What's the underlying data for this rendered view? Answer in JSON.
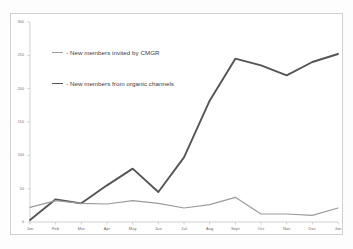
{
  "figure": {
    "background_color": "#fdfdfd",
    "plot_border_color": "#cfcfcf"
  },
  "legend": {
    "position": "inside-top-left",
    "entries": [
      {
        "label": "- New members invited by CMGR",
        "color": "#9b9b9b",
        "swatch": "line-swatch-light"
      },
      {
        "label": "- New members from organic channels",
        "color": "#555555",
        "swatch": "line-swatch-dark"
      }
    ]
  },
  "axes": {
    "y_ticks": [
      "0",
      "50",
      "100",
      "150",
      "200",
      "250",
      "300"
    ],
    "x_ticks": [
      "Jan",
      "Feb",
      "Mar",
      "Apr",
      "May",
      "Jun",
      "Jul",
      "Aug",
      "Sept",
      "Oct",
      "Nov",
      "Dec",
      "Jan"
    ]
  },
  "chart_data": {
    "type": "line",
    "title": "",
    "xlabel": "",
    "ylabel": "",
    "ylim": [
      0,
      300
    ],
    "yticks": [
      0,
      50,
      100,
      150,
      200,
      250,
      300
    ],
    "grid": false,
    "legend_position": "inside-top-left",
    "categories": [
      "Jan",
      "Feb",
      "Mar",
      "Apr",
      "May",
      "Jun",
      "Jul",
      "Aug",
      "Sept",
      "Oct",
      "Nov",
      "Dec",
      "Jan"
    ],
    "series": [
      {
        "name": "- New members invited by CMGR",
        "color": "#9b9b9b",
        "values": [
          22,
          32,
          28,
          27,
          32,
          28,
          21,
          26,
          37,
          12,
          12,
          10,
          21
        ]
      },
      {
        "name": "- New members from organic channels",
        "color": "#555555",
        "values": [
          3,
          34,
          28,
          55,
          80,
          45,
          97,
          182,
          245,
          235,
          220,
          240,
          252
        ]
      }
    ]
  }
}
